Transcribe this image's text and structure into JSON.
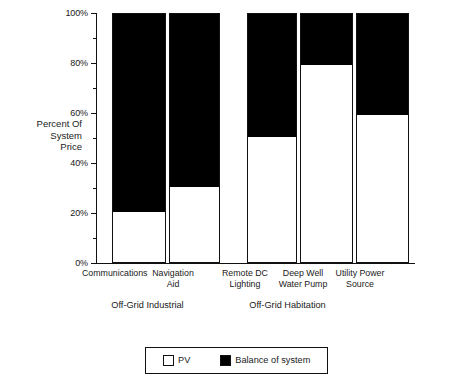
{
  "chart_data": {
    "type": "bar",
    "subtype": "stacked-100-percent",
    "title": "",
    "xlabel": "",
    "ylabel": "Percent Of\nSystem\nPrice",
    "ylim": [
      0,
      100
    ],
    "yunit": "%",
    "grid": false,
    "legend_position": "bottom",
    "categories": [
      "Communications",
      "Navigation\nAid",
      "Remote DC\nLighting",
      "Deep Well\nWater Pump",
      "Utility Power\nSource"
    ],
    "ytick_labels": [
      "0%",
      "20%",
      "40%",
      "60%",
      "80%",
      "100%"
    ],
    "ytick_values": [
      0,
      20,
      40,
      60,
      80,
      100
    ],
    "yminor_values": [
      10,
      30,
      50,
      70,
      90
    ],
    "series": [
      {
        "name": "PV",
        "color": "#ffffff",
        "values": [
          20,
          30,
          50,
          79,
          59
        ]
      },
      {
        "name": "Balance of system",
        "color": "#000000",
        "values": [
          80,
          70,
          50,
          21,
          41
        ]
      }
    ],
    "groups": [
      {
        "label": "Off-Grid Industrial",
        "categories": [
          "Communications",
          "Navigation Aid"
        ]
      },
      {
        "label": "Off-Grid Habitation",
        "categories": [
          "Remote DC Lighting",
          "Deep Well Water Pump",
          "Utility Power Source"
        ]
      }
    ],
    "legend": [
      {
        "label": "PV",
        "color": "#ffffff"
      },
      {
        "label": "Balance of system",
        "color": "#000000"
      }
    ]
  },
  "axis": {
    "y_title": "Percent Of\nSystem\nPrice",
    "ticks": [
      {
        "label": "100%"
      },
      {
        "label": "80%"
      },
      {
        "label": "60%"
      },
      {
        "label": "40%"
      },
      {
        "label": "20%"
      },
      {
        "label": "0%"
      }
    ]
  },
  "x_labels": [
    {
      "text": "Communications"
    },
    {
      "text": "Navigation\nAid"
    },
    {
      "text": "Remote DC\nLighting"
    },
    {
      "text": "Deep Well\nWater Pump"
    },
    {
      "text": "Utility Power\nSource"
    }
  ],
  "group_labels": [
    {
      "text": "Off-Grid Industrial"
    },
    {
      "text": "Off-Grid Habitation"
    }
  ],
  "legend": {
    "items": [
      {
        "label": "PV"
      },
      {
        "label": "Balance of system"
      }
    ]
  }
}
